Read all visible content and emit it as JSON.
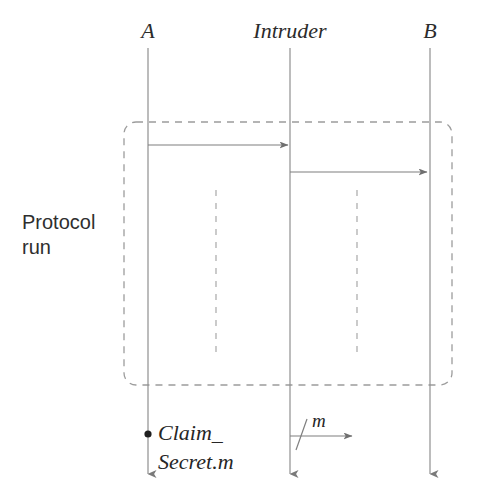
{
  "diagram": {
    "type": "message-sequence-chart",
    "title_visible": false,
    "background_color": "#ffffff",
    "line_color": "#8a8a8a",
    "text_color": "#262626",
    "lifelines": [
      {
        "id": "A",
        "label": "A",
        "x": 148,
        "top_y": 48,
        "bottom_y": 480
      },
      {
        "id": "Intruder",
        "label": "Intruder",
        "x": 290,
        "top_y": 48,
        "bottom_y": 480
      },
      {
        "id": "B",
        "label": "B",
        "x": 430,
        "top_y": 48,
        "bottom_y": 480
      }
    ],
    "protocol_run_box": {
      "label": "Protocol\nrun",
      "label_line_1": "Protocol",
      "label_line_2": "run",
      "label_x": 22,
      "label_y": 212,
      "x": 124,
      "y": 122,
      "width": 328,
      "height": 263,
      "stroke_style": "dashed",
      "corner_radius": 12,
      "inner_dashed_lines": [
        {
          "x": 216,
          "y1": 190,
          "y2": 358
        },
        {
          "x": 357,
          "y1": 190,
          "y2": 358
        }
      ]
    },
    "messages": [
      {
        "id": "msg-a-to-intruder",
        "from": "A",
        "to": "Intruder",
        "label": "",
        "x1": 148,
        "x2": 288,
        "y": 145
      },
      {
        "id": "msg-intruder-to-b",
        "from": "Intruder",
        "to": "B",
        "label": "",
        "x1": 290,
        "x2": 427,
        "y": 172
      },
      {
        "id": "msg-intruder-leak-m",
        "from": "Intruder",
        "to": "",
        "label": "m",
        "label_x": 318,
        "label_y": 411,
        "x1": 290,
        "x2": 352,
        "y": 436,
        "has_slash_mark": true,
        "slash_x": 301
      }
    ],
    "claim": {
      "id": "claim-secret",
      "marker": "filled-dot",
      "marker_x": 148,
      "marker_y": 434,
      "line_1": "Claim_",
      "line_2": "Secret.m",
      "text_x": 158,
      "text_y": 420
    }
  }
}
